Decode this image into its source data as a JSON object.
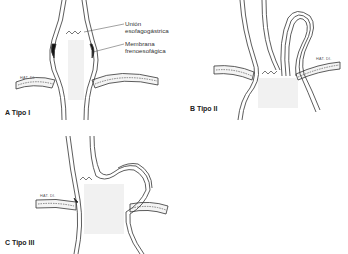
{
  "figure": {
    "panels": [
      {
        "id": "A",
        "label": "A  Tipo I"
      },
      {
        "id": "B",
        "label": "B  Tipo II"
      },
      {
        "id": "C",
        "label": "C  Tipo III"
      }
    ],
    "annotations": {
      "gej_line1": "Unión",
      "gej_line2": "esofagogástrica",
      "membrane_line1": "Membrana",
      "membrane_line2": "frenoesofágica"
    },
    "diaphragm_labels": {
      "a": "HAT. DI.",
      "b": "HAT. DI.",
      "c": "HAT. DI."
    }
  }
}
